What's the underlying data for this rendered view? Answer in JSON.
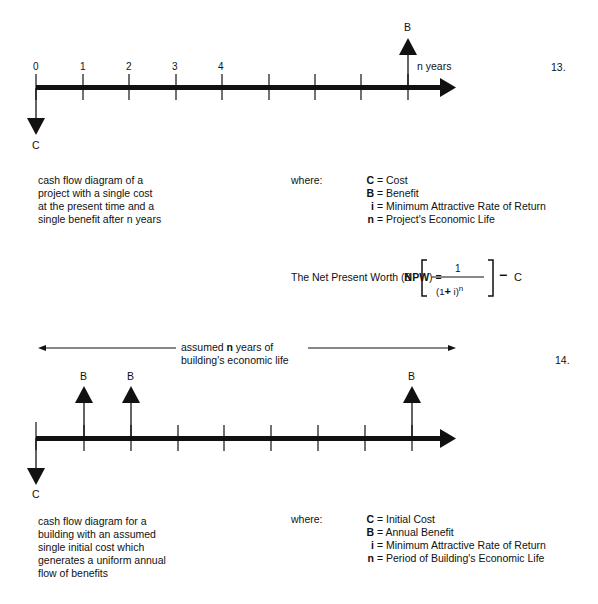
{
  "diagram13": {
    "number": "13.",
    "tick_labels": [
      "0",
      "1",
      "2",
      "3",
      "4"
    ],
    "cost_label": "C",
    "benefit_label": "B",
    "end_label": "n years",
    "description": [
      "cash flow diagram of a",
      "project with a single cost",
      "at the present time and a",
      "single benefit after n years"
    ],
    "where_label": "where:",
    "definitions": [
      {
        "symbol": "C",
        "text": "= Cost"
      },
      {
        "symbol": "B",
        "text": "= Benefit"
      },
      {
        "symbol": "i",
        "text": "= Minimum Attractive Rate of Return"
      },
      {
        "symbol": "n",
        "text": "= Project's Economic Life"
      }
    ],
    "formula": {
      "prefix": "The  Net Present Worth (",
      "acronym": "NPW",
      "suffix": ") =",
      "multiplier": "B",
      "numerator": "1",
      "denominator_open": "(1",
      "plus": "+",
      "denominator_var": " i)",
      "exponent": "n",
      "minus": "−",
      "subtrahend": "C"
    }
  },
  "diagram14": {
    "number": "14.",
    "span_label_line1_pre": "assumed ",
    "span_label_line1_bold": "n",
    "span_label_line1_post": " years of",
    "span_label_line2": "building's economic life",
    "benefit_labels": [
      "B",
      "B",
      "B"
    ],
    "cost_label": "C",
    "description": [
      "cash flow diagram for a",
      "building with an assumed",
      "single initial cost which",
      "generates a uniform annual",
      "flow of benefits"
    ],
    "where_label": "where:",
    "definitions": [
      {
        "symbol": "C",
        "text": "= Initial Cost"
      },
      {
        "symbol": "B",
        "text": "= Annual Benefit"
      },
      {
        "symbol": "i",
        "text": "= Minimum Attractive Rate of Return"
      },
      {
        "symbol": "n",
        "text": "= Period of Building's Economic Life"
      }
    ]
  }
}
